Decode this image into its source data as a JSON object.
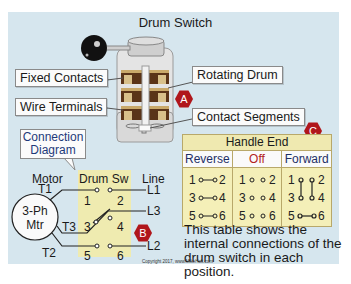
{
  "title": "Drum Switch",
  "labels": {
    "fixed_contacts": "Fixed Contacts",
    "rotating_drum": "Rotating Drum",
    "wire_terminals": "Wire Terminals",
    "contact_segments": "Contact Segments",
    "connection_diagram_line1": "Connection",
    "connection_diagram_line2": "Diagram"
  },
  "markers": {
    "a": "A",
    "b": "B",
    "c": "C"
  },
  "markers_color": "#b0161b",
  "circuit": {
    "motor_label": "Motor",
    "drum_sw_label": "Drum Sw",
    "line_label": "Line",
    "motor_name_line1": "3-Ph",
    "motor_name_line2": "Mtr",
    "terminals": [
      "T1",
      "T3",
      "T2"
    ],
    "lines": [
      "L1",
      "L3",
      "L2"
    ],
    "contacts": [
      "1",
      "2",
      "3",
      "4",
      "5",
      "6"
    ]
  },
  "table": {
    "header": "Handle End",
    "columns": [
      {
        "label": "Reverse",
        "rows": [
          "1",
          "2",
          "3",
          "4",
          "5",
          "6"
        ],
        "connections": [
          "1-2",
          "3-4",
          "5-6"
        ]
      },
      {
        "label": "Off",
        "rows": [
          "1",
          "2",
          "3",
          "4",
          "5",
          "6"
        ],
        "connections": []
      },
      {
        "label": "Forward",
        "rows": [
          "1",
          "2",
          "3",
          "4",
          "5",
          "6"
        ],
        "connections": [
          "1-3",
          "2-4",
          "5-6"
        ]
      }
    ]
  },
  "description": "This table shows the internal connections of the drum switch in each position.",
  "copyright": "Copyright 2017, www.MikeHolt.com"
}
